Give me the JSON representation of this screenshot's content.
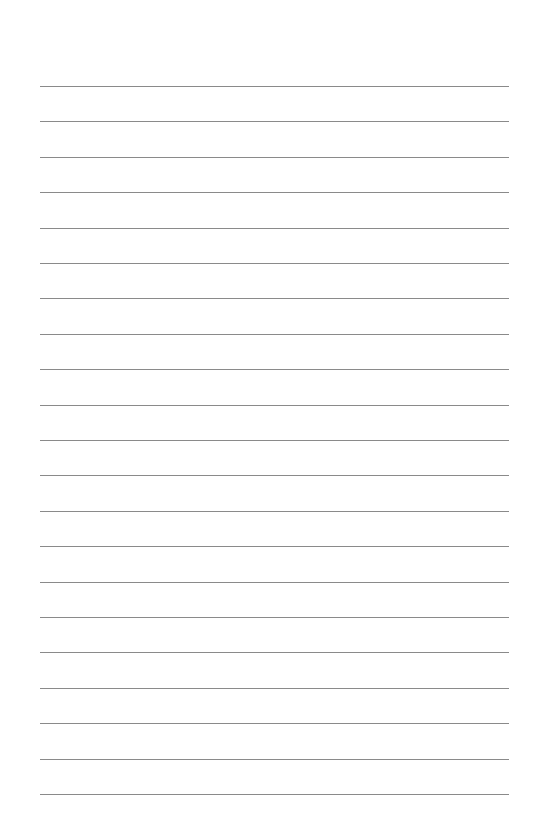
{
  "page": {
    "type": "lined-paper",
    "line_count": 21,
    "line_color": "#8a8a8a",
    "background_color": "#ffffff",
    "text": []
  }
}
